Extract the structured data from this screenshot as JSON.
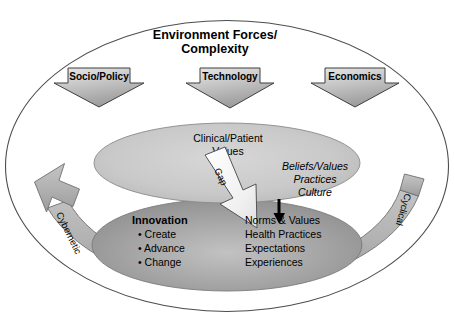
{
  "figure": {
    "title_line1": "Environment Forces/",
    "title_line2": "Complexity"
  },
  "force_arrows": [
    {
      "label": "Socio/Policy"
    },
    {
      "label": "Technology"
    },
    {
      "label": "Economics"
    }
  ],
  "upper_ellipse": {
    "heading_line1": "Clinical/Patient",
    "heading_line2": "Values",
    "italic_items": [
      "Beliefs/Values",
      "Practices",
      "Culture"
    ]
  },
  "gap_arrow": {
    "label": "Gap"
  },
  "lower_ellipse": {
    "innovation_heading": "Innovation",
    "innovation_bullets": [
      "• Create",
      "• Advance",
      "• Change"
    ],
    "outcome_items": [
      "Norms & Values",
      "Health Practices",
      "Expectations",
      "Experiences"
    ]
  },
  "cycle_band": {
    "left_label": "Cybernetic",
    "right_label": "Cyclical"
  },
  "colors": {
    "outline": "#4d4d4d",
    "upper_ellipse_fill": "#c9c9c9",
    "lower_ellipse_fill": "#a3a3a3",
    "band_fill": "#b0b0b0",
    "force_arrow_fill": "#bdbdbd",
    "gap_arrow_fill": "#f2f2f2",
    "text": "#000000"
  }
}
